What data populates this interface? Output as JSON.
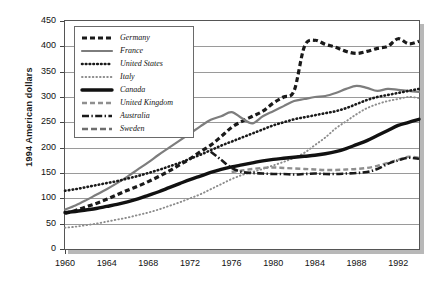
{
  "chart_data": {
    "type": "line",
    "title": "",
    "xlabel": "",
    "ylabel": "1994 American dollars",
    "xlim": [
      1960,
      1994
    ],
    "ylim": [
      0,
      450
    ],
    "grid": true,
    "legend_position": "top-left-inside",
    "ytick_labels": [
      "0",
      "50",
      "100",
      "150",
      "200",
      "250",
      "300",
      "350",
      "400",
      "450"
    ],
    "ytick_values": [
      0,
      50,
      100,
      150,
      200,
      250,
      300,
      350,
      400,
      450
    ],
    "xtick_labels": [
      "1960",
      "1964",
      "1968",
      "1972",
      "1976",
      "1980",
      "1984",
      "1988",
      "1992"
    ],
    "xtick_values": [
      1960,
      1964,
      1968,
      1972,
      1976,
      1980,
      1984,
      1988,
      1992
    ],
    "x": [
      1960,
      1961,
      1962,
      1963,
      1964,
      1965,
      1966,
      1967,
      1968,
      1969,
      1970,
      1971,
      1972,
      1973,
      1974,
      1975,
      1976,
      1977,
      1978,
      1979,
      1980,
      1981,
      1982,
      1983,
      1984,
      1985,
      1986,
      1987,
      1988,
      1989,
      1990,
      1991,
      1992,
      1993,
      1994
    ],
    "series": [
      {
        "name": "Germany",
        "color": "#1a1a1a",
        "style": "thick-dash",
        "values": [
          70,
          76,
          83,
          90,
          98,
          107,
          116,
          124,
          133,
          143,
          154,
          166,
          178,
          192,
          205,
          222,
          240,
          252,
          262,
          272,
          288,
          300,
          312,
          400,
          412,
          404,
          398,
          390,
          386,
          390,
          396,
          400,
          415,
          405,
          410
        ]
      },
      {
        "name": "France",
        "color": "#7d7d7d",
        "style": "solid-gray",
        "values": [
          78,
          86,
          96,
          107,
          118,
          130,
          143,
          157,
          171,
          186,
          200,
          214,
          228,
          242,
          255,
          262,
          270,
          258,
          248,
          262,
          272,
          282,
          292,
          296,
          300,
          302,
          308,
          316,
          322,
          318,
          312,
          316,
          314,
          312,
          310
        ]
      },
      {
        "name": "United States",
        "color": "#1a1a1a",
        "style": "dotted-med",
        "values": [
          115,
          118,
          122,
          126,
          130,
          134,
          139,
          144,
          150,
          156,
          163,
          170,
          178,
          186,
          195,
          204,
          212,
          220,
          228,
          236,
          244,
          250,
          256,
          260,
          264,
          268,
          272,
          278,
          286,
          294,
          300,
          304,
          308,
          312,
          316
        ]
      },
      {
        "name": "Italy",
        "color": "#8c8c8c",
        "style": "dotted-light",
        "values": [
          42,
          44,
          47,
          50,
          54,
          58,
          62,
          67,
          72,
          78,
          85,
          92,
          100,
          108,
          118,
          128,
          138,
          146,
          152,
          158,
          165,
          172,
          180,
          190,
          205,
          220,
          238,
          252,
          266,
          278,
          286,
          292,
          296,
          300,
          298
        ]
      },
      {
        "name": "Canada",
        "color": "#111111",
        "style": "thick-solid",
        "values": [
          72,
          74,
          77,
          80,
          84,
          88,
          93,
          99,
          106,
          113,
          121,
          129,
          137,
          144,
          151,
          157,
          162,
          166,
          170,
          174,
          177,
          179,
          181,
          183,
          185,
          188,
          192,
          198,
          206,
          214,
          224,
          234,
          244,
          250,
          256
        ]
      },
      {
        "name": "United Kingdom",
        "color": "#8f8f8f",
        "style": "dash-gray",
        "values": [
          null,
          null,
          null,
          null,
          null,
          null,
          null,
          null,
          null,
          null,
          null,
          null,
          null,
          null,
          null,
          null,
          152,
          155,
          158,
          160,
          161,
          160,
          159,
          158,
          157,
          156,
          156,
          157,
          158,
          160,
          164,
          170,
          176,
          182,
          180
        ]
      },
      {
        "name": "Australia",
        "color": "#1a1a1a",
        "style": "dash-dot",
        "values": [
          null,
          null,
          null,
          null,
          null,
          null,
          null,
          null,
          null,
          null,
          null,
          null,
          null,
          null,
          192,
          176,
          160,
          152,
          150,
          149,
          148,
          148,
          147,
          148,
          149,
          148,
          148,
          149,
          150,
          152,
          158,
          168,
          175,
          180,
          178
        ]
      },
      {
        "name": "Sweden",
        "color": "#6e6e6e",
        "style": "dash-sweden",
        "values": [
          null,
          null,
          null,
          null,
          null,
          null,
          null,
          null,
          null,
          null,
          null,
          null,
          null,
          null,
          null,
          null,
          null,
          null,
          null,
          null,
          null,
          null,
          null,
          null,
          null,
          null,
          null,
          null,
          null,
          null,
          null,
          null,
          null,
          null,
          null
        ]
      }
    ]
  },
  "legend": {
    "items": [
      {
        "label": "Germany"
      },
      {
        "label": "France"
      },
      {
        "label": "United States"
      },
      {
        "label": "Italy"
      },
      {
        "label": "Canada"
      },
      {
        "label": "United Kingdom"
      },
      {
        "label": "Australia"
      },
      {
        "label": "Sweden"
      }
    ]
  },
  "axis": {
    "y_title": "1994 American dollars"
  }
}
